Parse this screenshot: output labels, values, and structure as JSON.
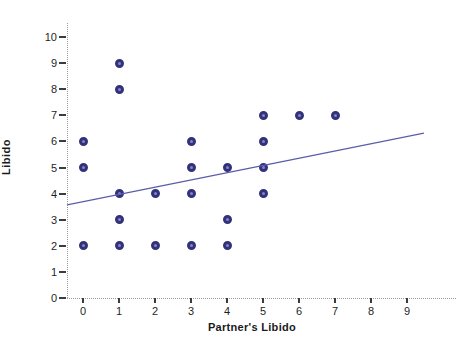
{
  "chart_data": {
    "type": "scatter",
    "title": "",
    "xlabel": "Partner's Libido",
    "ylabel": "Libido",
    "xlim": [
      -0.5,
      9.6
    ],
    "ylim": [
      0,
      10.6
    ],
    "x_ticks": [
      0,
      1,
      2,
      3,
      4,
      5,
      6,
      7,
      8,
      9
    ],
    "y_ticks": [
      0,
      1,
      2,
      3,
      4,
      5,
      6,
      7,
      8,
      9,
      10
    ],
    "grid": false,
    "legend": "none",
    "points": [
      [
        0,
        2
      ],
      [
        0,
        5
      ],
      [
        0,
        6
      ],
      [
        1,
        2
      ],
      [
        1,
        3
      ],
      [
        1,
        4
      ],
      [
        1,
        8
      ],
      [
        1,
        9
      ],
      [
        2,
        2
      ],
      [
        2,
        4
      ],
      [
        3,
        2
      ],
      [
        3,
        4
      ],
      [
        3,
        5
      ],
      [
        3,
        6
      ],
      [
        4,
        2
      ],
      [
        4,
        3
      ],
      [
        4,
        5
      ],
      [
        5,
        4
      ],
      [
        5,
        5
      ],
      [
        5,
        6
      ],
      [
        5,
        7
      ],
      [
        6,
        7
      ],
      [
        7,
        7
      ]
    ],
    "regression_line": {
      "x1": -0.44,
      "y1": 3.57,
      "x2": 9.47,
      "y2": 6.32
    },
    "colors": {
      "marker_ring": "#31317c",
      "marker_core": "#8585bd",
      "line": "#5c5caa",
      "axis": "#9a9a9a",
      "tick": "#3c3c3c",
      "text": "#1f1f1f",
      "background": "#ffffff"
    }
  }
}
